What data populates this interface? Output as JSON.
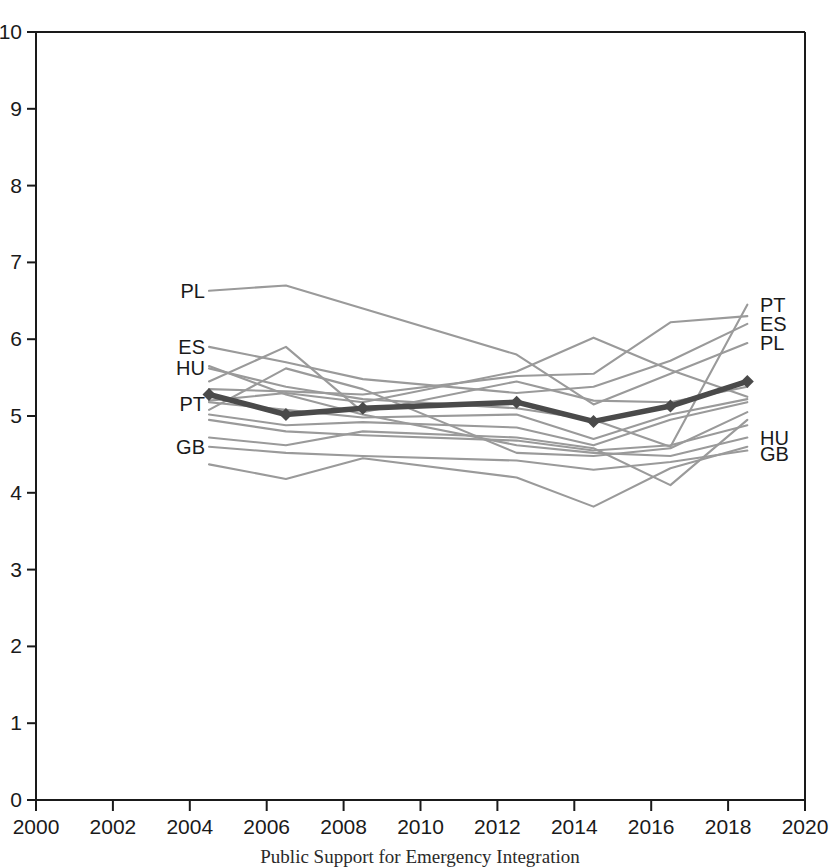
{
  "chart_data": {
    "type": "line",
    "title": "",
    "subtitle": "",
    "xlabel": "",
    "ylabel": "",
    "xlim": [
      2000,
      2020
    ],
    "ylim": [
      0,
      10
    ],
    "x_ticks": [
      2000,
      2002,
      2004,
      2006,
      2008,
      2010,
      2012,
      2014,
      2016,
      2018,
      2020
    ],
    "y_ticks": [
      0,
      1,
      2,
      3,
      4,
      5,
      6,
      7,
      8,
      9,
      10
    ],
    "grid": false,
    "legend_position": "inline-endpoints",
    "x": [
      2004.5,
      2006.5,
      2008.5,
      2012.5,
      2014.5,
      2016.5,
      2018.5
    ],
    "highlight_series": "PT",
    "series": [
      {
        "name": "PT",
        "highlight": true,
        "markers": true,
        "values": [
          5.28,
          5.02,
          5.1,
          5.18,
          4.93,
          5.13,
          5.45
        ]
      },
      {
        "name": "PL",
        "highlight": false,
        "markers": false,
        "values": [
          6.63,
          6.7,
          6.4,
          5.8,
          5.15,
          5.55,
          5.95
        ]
      },
      {
        "name": "ES",
        "highlight": false,
        "markers": false,
        "values": [
          5.9,
          5.7,
          5.48,
          5.3,
          5.38,
          5.72,
          6.2
        ]
      },
      {
        "name": "HU",
        "highlight": false,
        "markers": false,
        "values": [
          5.65,
          5.28,
          5.02,
          4.62,
          4.52,
          4.48,
          4.72
        ]
      },
      {
        "name": "GB",
        "highlight": false,
        "markers": false,
        "values": [
          4.6,
          4.52,
          4.48,
          4.42,
          4.3,
          4.4,
          4.55
        ]
      },
      {
        "name": "S6",
        "highlight": false,
        "markers": false,
        "values": [
          5.62,
          5.38,
          5.22,
          5.1,
          4.95,
          4.6,
          6.45
        ]
      },
      {
        "name": "S7",
        "highlight": false,
        "markers": false,
        "values": [
          5.35,
          5.32,
          5.28,
          5.52,
          5.55,
          6.22,
          6.3
        ]
      },
      {
        "name": "S8",
        "highlight": false,
        "markers": false,
        "values": [
          5.2,
          5.3,
          5.18,
          5.58,
          6.02,
          5.6,
          5.25
        ]
      },
      {
        "name": "S9",
        "highlight": false,
        "markers": false,
        "values": [
          5.18,
          5.08,
          4.98,
          5.02,
          4.7,
          5.02,
          5.22
        ]
      },
      {
        "name": "S10",
        "highlight": false,
        "markers": false,
        "values": [
          5.02,
          4.88,
          4.92,
          4.85,
          4.62,
          4.95,
          5.18
        ]
      },
      {
        "name": "S11",
        "highlight": false,
        "markers": false,
        "values": [
          4.95,
          4.8,
          4.75,
          4.68,
          4.55,
          4.62,
          4.88
        ]
      },
      {
        "name": "S12",
        "highlight": false,
        "markers": false,
        "values": [
          4.72,
          4.62,
          4.8,
          4.72,
          4.58,
          4.1,
          4.95
        ]
      },
      {
        "name": "S13",
        "highlight": false,
        "markers": false,
        "values": [
          4.37,
          4.18,
          4.45,
          4.2,
          3.82,
          4.32,
          4.6
        ]
      },
      {
        "name": "S14",
        "highlight": false,
        "markers": false,
        "values": [
          5.45,
          5.9,
          5.05,
          5.45,
          5.2,
          5.18,
          5.38
        ]
      },
      {
        "name": "S15",
        "highlight": false,
        "markers": false,
        "values": [
          5.08,
          5.62,
          5.35,
          4.52,
          4.48,
          4.58,
          5.05
        ]
      }
    ],
    "left_labels": [
      {
        "text": "PL",
        "value": 6.63
      },
      {
        "text": "ES",
        "value": 5.9
      },
      {
        "text": "HU",
        "value": 5.62
      },
      {
        "text": "PT",
        "value": 5.15
      },
      {
        "text": "GB",
        "value": 4.6
      }
    ],
    "right_labels": [
      {
        "text": "PT",
        "value": 6.45
      },
      {
        "text": "ES",
        "value": 6.2
      },
      {
        "text": "PL",
        "value": 5.95
      },
      {
        "text": "HU",
        "value": 4.72
      },
      {
        "text": "GB",
        "value": 4.5
      }
    ],
    "colors": {
      "highlight_line": "#4a4a4a",
      "series_line": "#9a9a9a",
      "axis": "#1a1a1a",
      "text": "#1a1a1a",
      "background": "#ffffff"
    }
  },
  "caption": {
    "text": "Public Support for Emergency Integration"
  }
}
